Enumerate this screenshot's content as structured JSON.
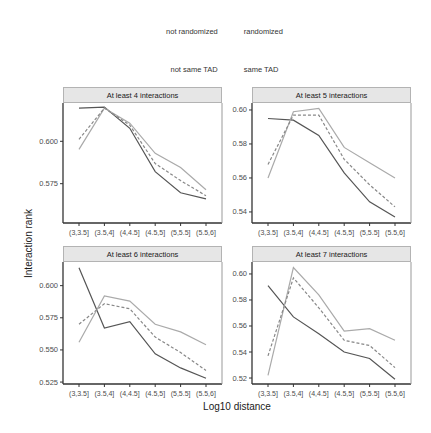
{
  "legend": {
    "linetype": [
      {
        "label": "not randomized",
        "style": "solid"
      },
      {
        "label": "randomized",
        "style": "dashed"
      }
    ],
    "colour": [
      {
        "label": "not same TAD",
        "color": "#555555"
      },
      {
        "label": "same TAD",
        "color": "#aaaaaa"
      }
    ]
  },
  "axes": {
    "xlabel": "Log10 distance",
    "ylabel": "Interaction rank"
  },
  "chart_data": [
    {
      "type": "line",
      "title": "At least 4 interactions",
      "categories": [
        "(3,3.5]",
        "(3.5,4]",
        "(4,4.5]",
        "(4.5,5]",
        "(5,5.5]",
        "(5.5,6]"
      ],
      "yticks": [
        0.575,
        0.6
      ],
      "ytick_labels": [
        "0.575",
        "0.600"
      ],
      "ylim": [
        0.5518,
        0.6226
      ],
      "series": [
        {
          "name": "not same TAD",
          "linetype": "not randomized",
          "color": "#555555",
          "dash": false,
          "values": [
            0.6196,
            0.6202,
            0.6077,
            0.5821,
            0.5696,
            0.5661
          ]
        },
        {
          "name": "same TAD",
          "linetype": "not randomized",
          "color": "#aaaaaa",
          "dash": false,
          "values": [
            0.5952,
            0.6196,
            0.6107,
            0.5929,
            0.5845,
            0.5714
          ]
        },
        {
          "name": "randomized",
          "linetype": "randomized",
          "color": "#888888",
          "dash": true,
          "values": [
            0.6012,
            0.6196,
            0.6095,
            0.5869,
            0.5768,
            0.5679
          ]
        }
      ],
      "xlabel": "Log10 distance",
      "ylabel": "Interaction rank",
      "grid": false
    },
    {
      "type": "line",
      "title": "At least 5 interactions",
      "categories": [
        "(3,3.5]",
        "(3.5,4]",
        "(4,4.5]",
        "(4.5,5]",
        "(5,5.5]",
        "(5.5,6]"
      ],
      "yticks": [
        0.54,
        0.56,
        0.58,
        0.6
      ],
      "ytick_labels": [
        "0.54",
        "0.56",
        "0.58",
        "0.60"
      ],
      "ylim": [
        0.5335,
        0.6041
      ],
      "series": [
        {
          "name": "not same TAD",
          "linetype": "not randomized",
          "color": "#555555",
          "dash": false,
          "values": [
            0.595,
            0.594,
            0.585,
            0.563,
            0.546,
            0.537
          ]
        },
        {
          "name": "same TAD",
          "linetype": "not randomized",
          "color": "#aaaaaa",
          "dash": false,
          "values": [
            0.56,
            0.599,
            0.601,
            0.578,
            0.569,
            0.56
          ]
        },
        {
          "name": "randomized",
          "linetype": "randomized",
          "color": "#888888",
          "dash": true,
          "values": [
            0.568,
            0.597,
            0.597,
            0.571,
            0.556,
            0.543
          ]
        }
      ],
      "xlabel": "Log10 distance",
      "ylabel": "Interaction rank",
      "grid": false
    },
    {
      "type": "line",
      "title": "At least 6 interactions",
      "categories": [
        "(3,3.5]",
        "(3.5,4]",
        "(4,4.5]",
        "(4.5,5]",
        "(5,5.5]",
        "(5.5,6]"
      ],
      "yticks": [
        0.525,
        0.55,
        0.575,
        0.6
      ],
      "ytick_labels": [
        "0.525",
        "0.550",
        "0.575",
        "0.600"
      ],
      "ylim": [
        0.5235,
        0.6184
      ],
      "series": [
        {
          "name": "not same TAD",
          "linetype": "not randomized",
          "color": "#555555",
          "dash": false,
          "values": [
            0.614,
            0.567,
            0.572,
            0.547,
            0.536,
            0.528
          ]
        },
        {
          "name": "same TAD",
          "linetype": "not randomized",
          "color": "#aaaaaa",
          "dash": false,
          "values": [
            0.556,
            0.592,
            0.588,
            0.57,
            0.564,
            0.554
          ]
        },
        {
          "name": "randomized",
          "linetype": "randomized",
          "color": "#888888",
          "dash": true,
          "values": [
            0.57,
            0.586,
            0.582,
            0.56,
            0.548,
            0.534
          ]
        }
      ],
      "xlabel": "Log10 distance",
      "ylabel": "Interaction rank",
      "grid": false
    },
    {
      "type": "line",
      "title": "At least 7 interactions",
      "categories": [
        "(3,3.5]",
        "(3.5,4]",
        "(4,4.5]",
        "(4.5,5]",
        "(5,5.5]",
        "(5.5,6]"
      ],
      "yticks": [
        0.52,
        0.54,
        0.56,
        0.58,
        0.6
      ],
      "ytick_labels": [
        "0.52",
        "0.54",
        "0.56",
        "0.58",
        "0.60"
      ],
      "ylim": [
        0.5154,
        0.6092
      ],
      "series": [
        {
          "name": "not same TAD",
          "linetype": "not randomized",
          "color": "#555555",
          "dash": false,
          "values": [
            0.591,
            0.567,
            0.554,
            0.54,
            0.535,
            0.519
          ]
        },
        {
          "name": "same TAD",
          "linetype": "not randomized",
          "color": "#aaaaaa",
          "dash": false,
          "values": [
            0.522,
            0.605,
            0.584,
            0.556,
            0.558,
            0.549
          ]
        },
        {
          "name": "randomized",
          "linetype": "randomized",
          "color": "#888888",
          "dash": true,
          "values": [
            0.537,
            0.597,
            0.574,
            0.549,
            0.545,
            0.528
          ]
        }
      ],
      "xlabel": "Log10 distance",
      "ylabel": "Interaction rank",
      "grid": false
    }
  ]
}
